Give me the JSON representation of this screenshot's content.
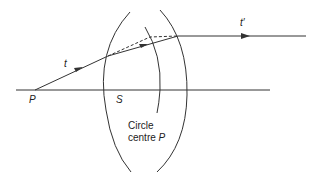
{
  "diagram": {
    "labels": {
      "point_p": "P",
      "point_s": "S",
      "ray_t": "t",
      "ray_t_prime": "t′",
      "circle_line1": "Circle",
      "circle_line2_prefix": "centre",
      "circle_line2_p": "P"
    },
    "colors": {
      "stroke": "#333333",
      "background": "#ffffff"
    },
    "elements": [
      "optical-axis",
      "lens-left-surface",
      "lens-right-surface",
      "reference-circle-arc-centre-P",
      "incident-ray-t",
      "refracted-ray-inside-lens",
      "dashed-construction-line",
      "emergent-ray-t-prime"
    ]
  }
}
